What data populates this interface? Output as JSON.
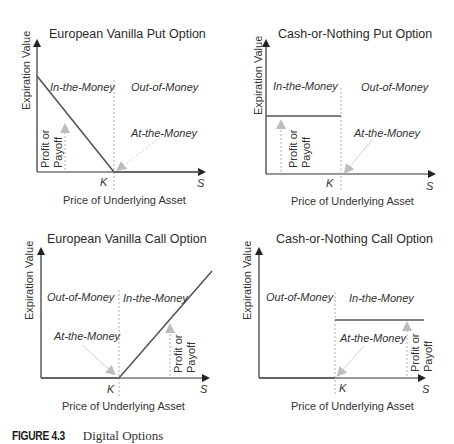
{
  "figure": {
    "caption_number": "FIGURE 4.3",
    "caption_text": "Digital Options"
  },
  "common": {
    "y_axis_label": "Expiration Value",
    "x_axis_label": "Price of Underlying Asset",
    "strike_label": "K",
    "price_label": "S",
    "profit_label_line1": "Profit or",
    "profit_label_line2": "Payoff",
    "at_the_money": "At-the-Money"
  },
  "panels": {
    "vanilla_put": {
      "title": "European Vanilla Put Option",
      "left_region": "In-the-Money",
      "right_region": "Out-of-Money"
    },
    "cash_put": {
      "title": "Cash-or-Nothing Put Option",
      "left_region": "In-the-Money",
      "right_region": "Out-of-Money"
    },
    "vanilla_call": {
      "title": "European Vanilla Call Option",
      "left_region": "Out-of-Money",
      "right_region": "In-the-Money"
    },
    "cash_call": {
      "title": "Cash-or-Nothing Call Option",
      "left_region": "Out-of-Money",
      "right_region": "In-the-Money"
    }
  },
  "colors": {
    "payoff_line": "#555555",
    "axis": "#333333",
    "guide": "#b0b0b0",
    "marker": "#bdbdbd"
  }
}
